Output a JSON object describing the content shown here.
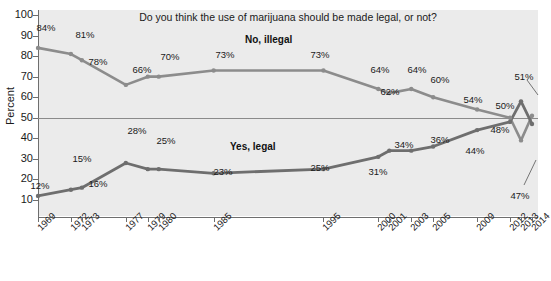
{
  "chart_data": {
    "type": "line",
    "title": "Do you think the use of marijuana should be made legal, or not?",
    "xlabel": "",
    "ylabel": "Percent",
    "ylim": [
      10,
      100
    ],
    "yticks": [
      10,
      20,
      30,
      40,
      50,
      60,
      70,
      80,
      90,
      100
    ],
    "grid": "horizontal reference line at 50",
    "legend_position": "inline annotations on lines",
    "categories": [
      "1969",
      "1972",
      "1973",
      "1977",
      "1979",
      "1980",
      "1985",
      "1995",
      "2000",
      "2001",
      "2003",
      "2005",
      "2009",
      "2012",
      "2013",
      "2014"
    ],
    "series": [
      {
        "name": "No, illegal",
        "color": "#8c8c8c",
        "values": [
          84,
          81,
          78,
          66,
          70,
          70,
          73,
          73,
          64,
          62,
          64,
          60,
          54,
          50,
          39,
          51
        ],
        "labels": [
          "84%",
          "81%",
          "78%",
          "66%",
          "70%",
          "",
          "73%",
          "73%",
          "64%",
          "62%",
          "64%",
          "60%",
          "54%",
          "50%",
          "",
          "51%"
        ]
      },
      {
        "name": "Yes, legal",
        "color": "#6e6e6e",
        "values": [
          12,
          15,
          16,
          28,
          25,
          25,
          23,
          25,
          31,
          34,
          34,
          36,
          44,
          48,
          58,
          47
        ],
        "labels": [
          "12%",
          "15%",
          "16%",
          "28%",
          "25%",
          "",
          "23%",
          "25%",
          "31%",
          "34%",
          "",
          "36%",
          "44%",
          "48%",
          "",
          "47%"
        ]
      }
    ],
    "annotations": [
      {
        "text": "No, illegal",
        "for": "series-no"
      },
      {
        "text": "Yes, legal",
        "for": "series-yes"
      }
    ]
  },
  "axis": {
    "y_title": "Percent",
    "y_tick_labels": [
      "100",
      "90",
      "80",
      "70",
      "60",
      "50",
      "40",
      "30",
      "20",
      "10"
    ],
    "x_tick_labels": [
      "1969",
      "1972",
      "1973",
      "1977",
      "1979",
      "1980",
      "1985",
      "1995",
      "2000",
      "2001",
      "2003",
      "2005",
      "2009",
      "2012",
      "2013",
      "2014"
    ]
  },
  "point_labels": {
    "no": [
      {
        "text": "84%",
        "x": 46,
        "y": 22
      },
      {
        "text": "81%",
        "x": 85,
        "y": 29
      },
      {
        "text": "78%",
        "x": 98,
        "y": 56
      },
      {
        "text": "66%",
        "x": 142,
        "y": 64
      },
      {
        "text": "70%",
        "x": 170,
        "y": 51
      },
      {
        "text": "73%",
        "x": 225,
        "y": 49
      },
      {
        "text": "73%",
        "x": 320,
        "y": 49
      },
      {
        "text": "64%",
        "x": 380,
        "y": 64
      },
      {
        "text": "62%",
        "x": 390,
        "y": 86
      },
      {
        "text": "64%",
        "x": 417,
        "y": 64
      },
      {
        "text": "60%",
        "x": 440,
        "y": 74
      },
      {
        "text": "54%",
        "x": 473,
        "y": 94
      },
      {
        "text": "50%",
        "x": 505,
        "y": 100
      },
      {
        "text": "51%",
        "x": 524,
        "y": 71
      }
    ],
    "yes": [
      {
        "text": "12%",
        "x": 40,
        "y": 180
      },
      {
        "text": "15%",
        "x": 82,
        "y": 153
      },
      {
        "text": "16%",
        "x": 98,
        "y": 178
      },
      {
        "text": "28%",
        "x": 137,
        "y": 125
      },
      {
        "text": "25%",
        "x": 166,
        "y": 135
      },
      {
        "text": "23%",
        "x": 223,
        "y": 166
      },
      {
        "text": "25%",
        "x": 320,
        "y": 162
      },
      {
        "text": "31%",
        "x": 378,
        "y": 166
      },
      {
        "text": "34%",
        "x": 404,
        "y": 139
      },
      {
        "text": "36%",
        "x": 440,
        "y": 134
      },
      {
        "text": "44%",
        "x": 475,
        "y": 145
      },
      {
        "text": "48%",
        "x": 500,
        "y": 124
      },
      {
        "text": "47%",
        "x": 520,
        "y": 190
      }
    ]
  }
}
